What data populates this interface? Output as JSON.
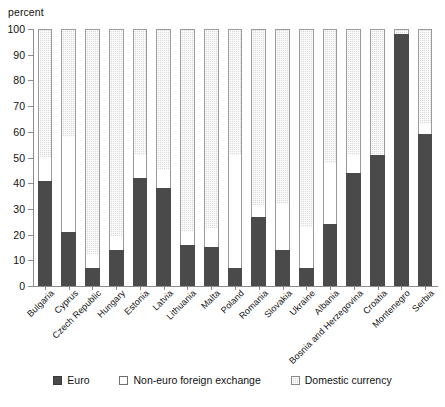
{
  "chart_data": {
    "type": "bar",
    "stacked": true,
    "title": "",
    "ylabel": "percent",
    "xlabel": "",
    "ylim": [
      0,
      100
    ],
    "yticks": [
      0,
      10,
      20,
      30,
      40,
      50,
      60,
      70,
      80,
      90,
      100
    ],
    "grid": false,
    "legend_position": "bottom",
    "categories": [
      "Bulgaria",
      "Cyprus",
      "Czech Republic",
      "Hungary",
      "Estonia",
      "Latvia",
      "Lithuania",
      "Malta",
      "Poland",
      "Romania",
      "Slovakia",
      "Ukraine",
      "Albania",
      "Bosnia and Herzegovina",
      "Croatia",
      "Montenegro",
      "Serbia"
    ],
    "series": [
      {
        "name": "Euro",
        "color": "#4a4a4a",
        "values": [
          41,
          21,
          7,
          14,
          42,
          38,
          16,
          15,
          7,
          27,
          14,
          7,
          24,
          44,
          51,
          98,
          59
        ]
      },
      {
        "name": "Non-euro foreign exchange",
        "color": "#ffffff",
        "values": [
          9,
          37,
          5,
          5,
          9,
          7,
          5,
          7,
          44,
          4,
          18,
          16,
          24,
          7,
          0,
          0,
          4
        ]
      },
      {
        "name": "Domestic currency",
        "color": "#d8d8d8",
        "values": [
          50,
          42,
          88,
          81,
          49,
          55,
          79,
          78,
          49,
          69,
          68,
          77,
          52,
          49,
          49,
          2,
          37
        ]
      }
    ],
    "notes": ""
  },
  "axis": {
    "y_title": "percent"
  },
  "legend": {
    "items": [
      {
        "label": "Euro",
        "swatch": "filled-dark-square"
      },
      {
        "label": "Non-euro foreign exchange",
        "swatch": "empty-square"
      },
      {
        "label": "Domestic currency",
        "swatch": "hatched-square"
      }
    ]
  }
}
